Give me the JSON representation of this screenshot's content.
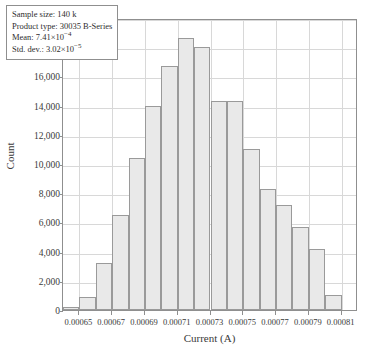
{
  "chart_data": {
    "type": "bar",
    "title": "",
    "subtitle": "",
    "xlabel": "Current (A)",
    "ylabel": "Count",
    "grid": true,
    "legend": null,
    "xlim": [
      0.00064,
      0.00082
    ],
    "ylim": [
      0,
      20000
    ],
    "bin_width": 1e-05,
    "categories": [
      "0.00064",
      "0.00065",
      "0.00066",
      "0.00067",
      "0.00068",
      "0.00069",
      "0.00070",
      "0.00071",
      "0.00072",
      "0.00073",
      "0.00074",
      "0.00075",
      "0.00076",
      "0.00077",
      "0.00078",
      "0.00079",
      "0.00080"
    ],
    "bin_left_edges": [
      0.00064,
      0.00065,
      0.00066,
      0.00067,
      0.00068,
      0.00069,
      0.0007,
      0.00071,
      0.00072,
      0.00073,
      0.00074,
      0.00075,
      0.00076,
      0.00077,
      0.00078,
      0.00079,
      0.0008
    ],
    "values": [
      200,
      900,
      3200,
      6500,
      10400,
      14000,
      16700,
      18600,
      18000,
      14300,
      14300,
      11000,
      8300,
      7200,
      5700,
      4200,
      1000
    ],
    "xticks": [
      "0.00065",
      "0.00067",
      "0.00069",
      "0.00071",
      "0.00073",
      "0.00075",
      "0.00077",
      "0.00079",
      "0.00081"
    ],
    "xtick_values": [
      0.00065,
      0.00067,
      0.00069,
      0.00071,
      0.00073,
      0.00075,
      0.00077,
      0.00079,
      0.00081
    ],
    "yticks": [
      "0",
      "2,000",
      "4,000",
      "6,000",
      "8,000",
      "10,000",
      "12,000",
      "14,000",
      "16,000",
      "18,000",
      "20,000"
    ],
    "ytick_values": [
      0,
      2000,
      4000,
      6000,
      8000,
      10000,
      12000,
      14000,
      16000,
      18000,
      20000
    ],
    "bar_color": "#e9e9e9",
    "bar_edge_color": "#9a9a9a",
    "grid_color": "#d8d8d8",
    "frame_color": "#8f8f8f"
  },
  "annotation": {
    "sample_size_label": "Sample size:",
    "sample_size_value": "140 k",
    "product_type_label": "Product type:",
    "product_type_value": "30035 B-Series",
    "mean_label": "Mean:",
    "mean_value": "7.41×10",
    "mean_exponent": "−4",
    "std_dev_label": "Std. dev.:",
    "std_dev_value": "3.02×10",
    "std_dev_exponent": "−5"
  }
}
